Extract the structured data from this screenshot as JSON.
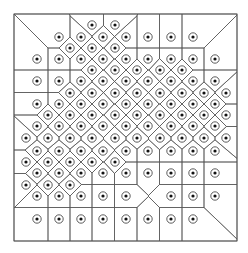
{
  "figure": {
    "type": "voronoi-diagram",
    "width": 248,
    "height": 253,
    "bounds": {
      "x0": 14,
      "y0": 14,
      "x1": 237,
      "y1": 241
    },
    "colors": {
      "background": "#ffffff",
      "lines": "#555555",
      "ring": "#333333",
      "dot": "#111111"
    },
    "site_marker": {
      "ring_radius": 4.2,
      "dot_radius": 1.6
    },
    "rows": [
      {
        "y": 25,
        "xs": [
          92,
          115
        ]
      },
      {
        "y": 37,
        "xs": [
          59,
          81,
          103,
          126,
          148,
          171,
          193
        ]
      },
      {
        "y": 48,
        "xs": [
          70,
          92,
          115
        ]
      },
      {
        "y": 59,
        "xs": [
          37,
          59,
          81,
          103,
          126,
          148,
          171,
          193,
          215
        ]
      },
      {
        "y": 70,
        "xs": [
          92,
          115,
          137,
          160,
          182
        ]
      },
      {
        "y": 81,
        "xs": [
          37,
          59,
          81,
          103,
          126,
          148,
          171,
          193,
          215
        ]
      },
      {
        "y": 93,
        "xs": [
          70,
          92,
          115,
          137,
          160,
          182,
          204,
          226
        ]
      },
      {
        "y": 104,
        "xs": [
          37,
          59,
          81,
          103,
          126,
          148,
          171,
          193,
          215
        ]
      },
      {
        "y": 115,
        "xs": [
          48,
          70,
          92,
          115,
          137,
          160,
          182,
          204,
          226
        ]
      },
      {
        "y": 126,
        "xs": [
          37,
          59,
          81,
          103,
          126,
          148,
          171,
          193,
          215
        ]
      },
      {
        "y": 138,
        "xs": [
          26,
          48,
          70,
          92,
          115,
          137,
          160,
          182,
          204,
          226
        ]
      },
      {
        "y": 151,
        "xs": [
          37,
          59,
          81,
          103,
          126,
          148,
          171,
          193,
          215
        ]
      },
      {
        "y": 162,
        "xs": [
          26,
          48,
          70,
          92,
          115
        ]
      },
      {
        "y": 173,
        "xs": [
          37,
          59,
          81,
          103,
          126,
          148,
          171,
          193,
          215
        ]
      },
      {
        "y": 185,
        "xs": [
          26,
          48,
          70
        ]
      },
      {
        "y": 196,
        "xs": [
          37,
          59,
          81,
          103,
          126,
          171,
          193,
          215
        ]
      },
      {
        "y": 219,
        "xs": [
          37,
          59,
          81,
          103,
          126,
          148,
          171,
          193
        ]
      }
    ]
  }
}
